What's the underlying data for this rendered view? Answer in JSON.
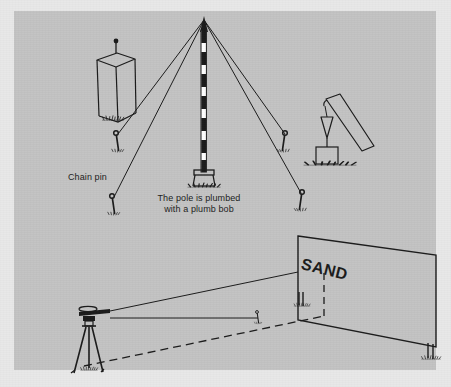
{
  "figure": {
    "kind": "surveying-instruction-illustration",
    "background_color": "#e8e8e8",
    "panel_color": "#c3c3c3",
    "ink_color": "#1b1b1b"
  },
  "labels": {
    "chain_pin": "Chain pin",
    "plumb_caption_line1": "The pole is plumbed",
    "plumb_caption_line2": "with a plumb bob",
    "sign_text": "SAND"
  },
  "scenes": {
    "top": {
      "name": "range-pole-plumbed-with-guy-wires",
      "elements": [
        "concrete-monument-with-tack",
        "banded-range-pole",
        "pole-base-stand",
        "guy-wire",
        "chain-pin",
        "plumb-bob-on-leaning-board"
      ],
      "pole": {
        "apex_x": 204,
        "apex_y": 18,
        "base_y": 170,
        "band_count": 9
      },
      "guy_wire_anchors": [
        {
          "x": 117,
          "y": 137
        },
        {
          "x": 285,
          "y": 137
        },
        {
          "x": 113,
          "y": 200
        },
        {
          "x": 300,
          "y": 196
        }
      ]
    },
    "bottom": {
      "name": "level-sighting-sand-billboard",
      "elements": [
        "surveyors-level-on-tripod",
        "line-of-sight",
        "dashed-ground-line",
        "chain-pin",
        "billboard-sign",
        "sign-support-post"
      ],
      "instrument_position": {
        "x": 96,
        "y": 318
      },
      "sign_corners": {
        "top_left_x": 298,
        "top_left_y": 236,
        "top_right_x": 436,
        "top_right_y": 255,
        "bottom_right_x": 436,
        "bottom_right_y": 347,
        "bottom_left_x": 298,
        "bottom_left_y": 320
      }
    }
  }
}
